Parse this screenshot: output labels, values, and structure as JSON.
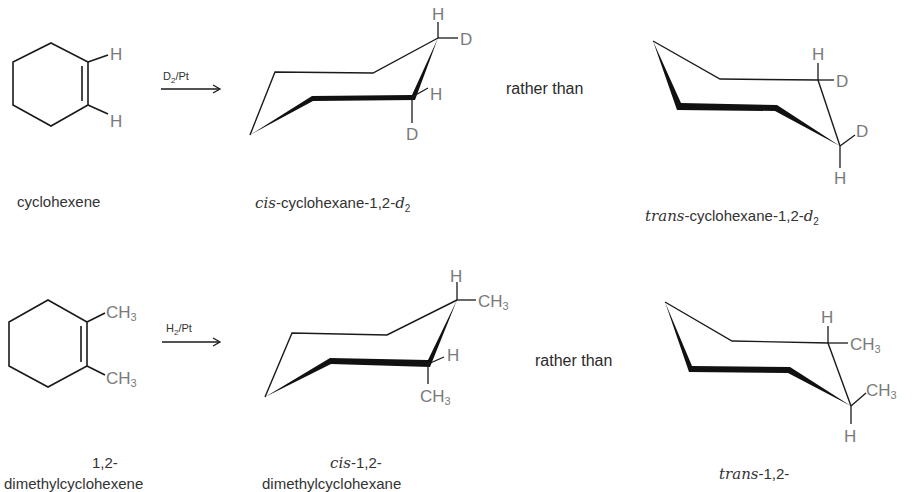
{
  "reactions": [
    {
      "reactant": {
        "name": "cyclohexene",
        "substituents": [
          "H",
          "H"
        ]
      },
      "reagent": {
        "main": "D",
        "sub": "2",
        "catalyst": "/Pt"
      },
      "product": {
        "prefix": "cis",
        "name": "-cyclohexane-1,2-",
        "suffix_italic": "d",
        "suffix_sub": "2",
        "atoms": [
          "H",
          "D",
          "H",
          "D"
        ]
      },
      "connector": "rather than",
      "alternative": {
        "prefix": "trans",
        "name": "-cyclohexane-1,2-",
        "suffix_italic": "d",
        "suffix_sub": "2",
        "atoms": [
          "H",
          "D",
          "D",
          "H"
        ]
      }
    },
    {
      "reactant": {
        "name_line1": "1,2-",
        "name_line2": "dimethylcyclohexene",
        "substituents": [
          "CH",
          "CH"
        ],
        "sub": "3"
      },
      "reagent": {
        "main": "H",
        "sub": "2",
        "catalyst": "/Pt"
      },
      "product": {
        "prefix": "cis",
        "name": "-1,2-",
        "name_line2": "dimethylcyclohexane",
        "atoms": [
          "H",
          "CH",
          "H",
          "CH"
        ],
        "sub": "3"
      },
      "connector": "rather than",
      "alternative": {
        "prefix": "trans",
        "name": "-1,2-",
        "atoms": [
          "H",
          "CH",
          "CH",
          "H"
        ],
        "sub": "3"
      }
    }
  ]
}
